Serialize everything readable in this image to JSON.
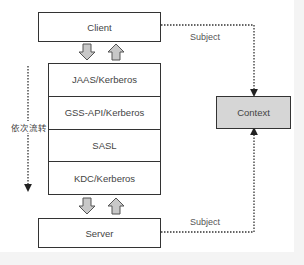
{
  "diagram": {
    "client": {
      "label": "Client"
    },
    "server": {
      "label": "Server"
    },
    "context": {
      "label": "Context",
      "fill": "#d6d6d6"
    },
    "stack": {
      "layers": [
        {
          "label": "JAAS/Kerberos"
        },
        {
          "label": "GSS-API/Kerberos"
        },
        {
          "label": "SASL"
        },
        {
          "label": "KDC/Kerberos"
        }
      ]
    },
    "flow_label": "依次流转",
    "edges": [
      {
        "from": "Client",
        "to": "Context",
        "label": "Subject",
        "style": "dotted"
      },
      {
        "from": "Server",
        "to": "Context",
        "label": "Subject",
        "style": "dotted"
      }
    ],
    "colors": {
      "border": "#333333",
      "arrow_fill": "#c8c8c8",
      "text": "#444444"
    }
  }
}
